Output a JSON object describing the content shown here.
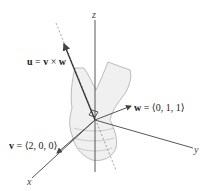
{
  "figure": {
    "type": "3D cross product diagram with right-hand rule",
    "axes": {
      "x": "x",
      "y": "y",
      "z": "z"
    },
    "labels": {
      "u": "u = v × w",
      "w": "w = ⟨0, 1, 1⟩",
      "v": "v = ⟨2, 0, 0⟩"
    },
    "label_parts": {
      "u_bold": "u",
      "u_rest": " = ",
      "u_v": "v",
      "u_times": " × ",
      "u_w": "w",
      "w_bold": "w",
      "w_rest": " = ⟨0, 1, 1⟩",
      "v_bold": "v",
      "v_rest": " = ⟨2, 0, 0⟩"
    },
    "vectors": [
      {
        "name": "v",
        "components": [
          2,
          0,
          0
        ]
      },
      {
        "name": "w",
        "components": [
          0,
          1,
          1
        ]
      },
      {
        "name": "u",
        "expression": "v × w"
      }
    ],
    "colors": {
      "axis": "#444444",
      "vector": "#555555",
      "hand_fill": "#efefef",
      "hand_stroke": "#9a9a9a"
    }
  }
}
